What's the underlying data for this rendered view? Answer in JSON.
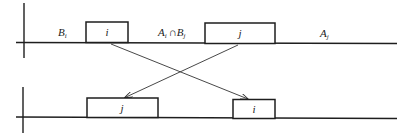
{
  "diagram": {
    "top_row": {
      "regions": [
        {
          "label": "B",
          "subscript": "i"
        },
        {
          "label": "A",
          "subscript": "i",
          "op": "∩",
          "label2": "B",
          "subscript2": "j"
        },
        {
          "label": "A",
          "subscript": "j"
        }
      ],
      "blocks": [
        {
          "label": "i"
        },
        {
          "label": "j"
        }
      ]
    },
    "bottom_row": {
      "blocks": [
        {
          "label": "j"
        },
        {
          "label": "i"
        }
      ]
    },
    "arrows": [
      {
        "from": "top block i",
        "to": "bottom block i"
      },
      {
        "from": "top block j",
        "to": "bottom block j"
      }
    ],
    "colors": {
      "stroke": "#1e1e1e",
      "background": "#ffffff"
    }
  }
}
